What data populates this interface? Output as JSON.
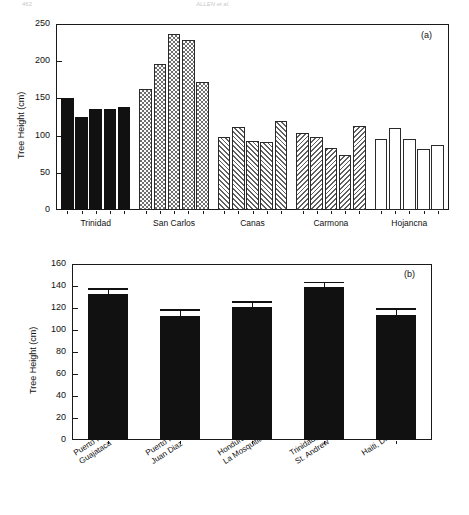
{
  "running_header": {
    "left": "462",
    "right": "ALLEN et al."
  },
  "figure": {
    "panels": [
      {
        "id": "a",
        "label": "(a)"
      },
      {
        "id": "b",
        "label": "(b)"
      }
    ]
  },
  "chart_data": [
    {
      "type": "bar",
      "panel": "(a)",
      "title": "",
      "xlabel": "",
      "ylabel": "Tree Height (cm)",
      "ylim": [
        0,
        250
      ],
      "yticks": [
        0,
        50,
        100,
        150,
        200,
        250
      ],
      "grid": false,
      "legend": "none",
      "groups": [
        {
          "name": "Trinidad",
          "fill": "solid",
          "values": [
            150,
            125,
            136,
            136,
            138
          ]
        },
        {
          "name": "San Carlos",
          "fill": "check",
          "values": [
            163,
            196,
            237,
            228,
            172
          ]
        },
        {
          "name": "Canas",
          "fill": "hatch-fwd",
          "values": [
            98,
            112,
            93,
            91,
            120
          ]
        },
        {
          "name": "Carmona",
          "fill": "hatch-back",
          "values": [
            104,
            98,
            83,
            74,
            113
          ]
        },
        {
          "name": "Hojancna",
          "fill": "open",
          "values": [
            96,
            110,
            95,
            82,
            87
          ]
        }
      ]
    },
    {
      "type": "bar",
      "panel": "(b)",
      "title": "",
      "xlabel": "",
      "ylabel": "Tree Height (cm)",
      "ylim": [
        0,
        160
      ],
      "yticks": [
        0,
        20,
        40,
        60,
        80,
        100,
        120,
        140,
        160
      ],
      "grid": false,
      "legend": "none",
      "fill": "solid",
      "categories": [
        "Puerto Rico, Guajataca",
        "Puerto Rico, Juan Diaz",
        "Honduras, La Mosquitia",
        "Trinidad, St. Andrew",
        "Haiti, Dirici"
      ],
      "category_lines": [
        [
          "Puerto Rico,",
          "Guajataca"
        ],
        [
          "Puerto Rico,",
          "Juan Diaz"
        ],
        [
          "Honduras,",
          "La Mosquitia"
        ],
        [
          "Trinidad,",
          "St. Andrew"
        ],
        [
          "Haiti, Dirici"
        ]
      ],
      "values": [
        133,
        113,
        121,
        139,
        114
      ],
      "errors": [
        5,
        6,
        5,
        5,
        6
      ]
    }
  ]
}
